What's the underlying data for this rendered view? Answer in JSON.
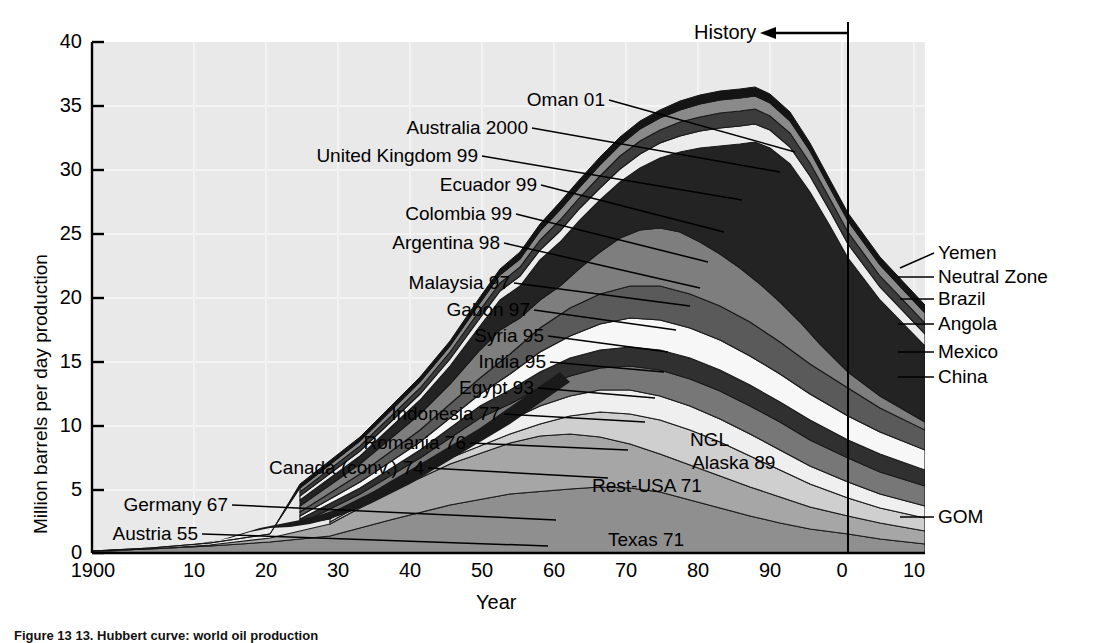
{
  "figure": {
    "caption": "Figure 13  13. Hubbert curve: world oil production"
  },
  "chart_data": {
    "type": "area",
    "stacked": true,
    "title": "",
    "xlabel": "Year",
    "ylabel": "Million barrels per day production",
    "xlim": [
      1900,
      2016
    ],
    "ylim": [
      0,
      40
    ],
    "ytick_values": [
      0,
      5,
      10,
      15,
      20,
      25,
      30,
      35,
      40
    ],
    "ytick_labels": [
      "0",
      "5",
      "10",
      "15",
      "20",
      "25",
      "30",
      "35",
      "40"
    ],
    "xtick_values": [
      1900,
      1910,
      1920,
      1930,
      1940,
      1950,
      1960,
      1970,
      1980,
      1990,
      2000,
      2010
    ],
    "xtick_labels": [
      "1900",
      "10",
      "20",
      "30",
      "40",
      "50",
      "60",
      "70",
      "80",
      "90",
      "0",
      "10"
    ],
    "grid": true,
    "legend": "none",
    "annotations": {
      "history_label": "History",
      "history_line_year": 2005
    },
    "x": [
      1900,
      1905,
      1910,
      1915,
      1920,
      1925,
      1930,
      1935,
      1940,
      1945,
      1950,
      1955,
      1960,
      1965,
      1970,
      1971,
      1973,
      1975,
      1977,
      1979,
      1980,
      1982,
      1985,
      1988,
      1990,
      1992,
      1995,
      1998,
      2000,
      2002,
      2004,
      2005,
      2006,
      2008,
      2010,
      2012,
      2014,
      2016
    ],
    "total_values": [
      0.4,
      0.6,
      0.9,
      1.2,
      1.9,
      2.6,
      3.4,
      3.8,
      5.2,
      6.2,
      9.6,
      13.2,
      18.4,
      24.0,
      32.0,
      33.2,
      35.5,
      33.0,
      36.5,
      38.0,
      36.0,
      32.0,
      31.5,
      34.0,
      35.5,
      35.0,
      36.0,
      38.0,
      39.0,
      38.5,
      40.0,
      40.0,
      39.5,
      38.0,
      35.5,
      33.0,
      30.5,
      28.0
    ],
    "series": [
      {
        "name": "Texas 71",
        "peak_year": 1971,
        "label": "Texas 71",
        "color": "#8c8c8c"
      },
      {
        "name": "Rest-USA 71",
        "peak_year": 1971,
        "label": "Rest-USA 71",
        "color": "#a6a6a6"
      },
      {
        "name": "Alaska 89",
        "peak_year": 1989,
        "label": "Alaska 89",
        "color": "#d9d9d9"
      },
      {
        "name": "NGL",
        "peak_year": null,
        "label": "NGL",
        "color": "#f2f2f2"
      },
      {
        "name": "GOM",
        "peak_year": null,
        "label": "GOM",
        "color": "#bfbfbf"
      },
      {
        "name": "Austria 55",
        "peak_year": 1955,
        "label": "Austria 55",
        "color": "#1a1a1a"
      },
      {
        "name": "Germany 67",
        "peak_year": 1967,
        "label": "Germany 67",
        "color": "#333333"
      },
      {
        "name": "Canada (conv.) 74",
        "peak_year": 1974,
        "label": "Canada (conv.) 74",
        "color": "#4d4d4d"
      },
      {
        "name": "Romania 76",
        "peak_year": 1976,
        "label": "Romania 76",
        "color": "#666666"
      },
      {
        "name": "Indonesia 77",
        "peak_year": 1977,
        "label": "Indonesia 77",
        "color": "#7a7a7a"
      },
      {
        "name": "Egypt 93",
        "peak_year": 1993,
        "label": "Egypt 93",
        "color": "#999999"
      },
      {
        "name": "India 95",
        "peak_year": 1995,
        "label": "India 95",
        "color": "#2b2b2b"
      },
      {
        "name": "Syria 95",
        "peak_year": 1995,
        "label": "Syria 95",
        "color": "#5c5c5c"
      },
      {
        "name": "Gabon 97",
        "peak_year": 1997,
        "label": "Gabon 97",
        "color": "#8f8f8f"
      },
      {
        "name": "Malaysia 97",
        "peak_year": 1997,
        "label": "Malaysia 97",
        "color": "#404040"
      },
      {
        "name": "Argentina 98",
        "peak_year": 1998,
        "label": "Argentina 98",
        "color": "#6e6e6e"
      },
      {
        "name": "Colombia 99",
        "peak_year": 1999,
        "label": "Colombia 99",
        "color": "#b3b3b3"
      },
      {
        "name": "Ecuador 99",
        "peak_year": 1999,
        "label": "Ecuador 99",
        "color": "#262626"
      },
      {
        "name": "United Kingdom 99",
        "peak_year": 1999,
        "label": "United Kingdom 99",
        "color": "#555555"
      },
      {
        "name": "Australia 2000",
        "peak_year": 2000,
        "label": "Australia 2000",
        "color": "#ededed"
      },
      {
        "name": "Oman 01",
        "peak_year": 2001,
        "label": "Oman 01",
        "color": "#737373"
      },
      {
        "name": "Norway 01",
        "peak_year": 2001,
        "label": "Norway 01",
        "color": "#1f1f1f"
      },
      {
        "name": "China",
        "peak_year": null,
        "label": "China",
        "color": "#a0a0a0"
      },
      {
        "name": "Mexico",
        "peak_year": null,
        "label": "Mexico",
        "color": "#303030"
      },
      {
        "name": "Angola",
        "peak_year": null,
        "label": "Angola",
        "color": "#717171"
      },
      {
        "name": "Brazil",
        "peak_year": null,
        "label": "Brazil",
        "color": "#2e2e2e"
      },
      {
        "name": "Neutral Zone",
        "peak_year": null,
        "label": "Neutral Zone",
        "color": "#949494"
      },
      {
        "name": "Yemen",
        "peak_year": null,
        "label": "Yemen",
        "color": "#585858"
      }
    ],
    "left_callouts": [
      {
        "label": "Oman 01",
        "x": 605,
        "y": 100,
        "tx": 795,
        "ty": 152
      },
      {
        "label": "Australia 2000",
        "x": 528,
        "y": 128,
        "tx": 780,
        "ty": 172
      },
      {
        "label": "United Kingdom 99",
        "x": 478,
        "y": 156,
        "tx": 742,
        "ty": 200
      },
      {
        "label": "Ecuador 99",
        "x": 537,
        "y": 185,
        "tx": 724,
        "ty": 232
      },
      {
        "label": "Colombia 99",
        "x": 512,
        "y": 214,
        "tx": 708,
        "ty": 262
      },
      {
        "label": "Argentina 98",
        "x": 500,
        "y": 243,
        "tx": 700,
        "ty": 288
      },
      {
        "label": "Malaysia 97",
        "x": 510,
        "y": 283,
        "tx": 690,
        "ty": 306
      },
      {
        "label": "Gabon 97",
        "x": 530,
        "y": 310,
        "tx": 676,
        "ty": 330
      },
      {
        "label": "Syria 95",
        "x": 544,
        "y": 336,
        "tx": 668,
        "ty": 352
      },
      {
        "label": "India 95",
        "x": 546,
        "y": 362,
        "tx": 664,
        "ty": 372
      },
      {
        "label": "Egypt 93",
        "x": 534,
        "y": 388,
        "tx": 655,
        "ty": 398
      },
      {
        "label": "Indonesia 77",
        "x": 500,
        "y": 414,
        "tx": 645,
        "ty": 422
      },
      {
        "label": "Romania 76",
        "x": 466,
        "y": 443,
        "tx": 628,
        "ty": 450
      },
      {
        "label": "Canada (conv.) 74",
        "x": 424,
        "y": 468,
        "tx": 608,
        "ty": 478
      },
      {
        "label": "Germany 67",
        "x": 228,
        "y": 505,
        "tx": 556,
        "ty": 520
      },
      {
        "label": "Austria 55",
        "x": 198,
        "y": 534,
        "tx": 548,
        "ty": 546
      }
    ],
    "right_callouts": [
      {
        "label": "Yemen",
        "x": 938,
        "y": 253,
        "tx": 900,
        "ty": 268
      },
      {
        "label": "Neutral Zone",
        "x": 938,
        "y": 277,
        "tx": 898,
        "ty": 277
      },
      {
        "label": "Brazil",
        "x": 938,
        "y": 299,
        "tx": 900,
        "ty": 299
      },
      {
        "label": "Angola",
        "x": 938,
        "y": 324,
        "tx": 898,
        "ty": 324
      },
      {
        "label": "Mexico",
        "x": 938,
        "y": 352,
        "tx": 898,
        "ty": 352
      },
      {
        "label": "China",
        "x": 938,
        "y": 377,
        "tx": 898,
        "ty": 377
      },
      {
        "label": "GOM",
        "x": 938,
        "y": 517,
        "tx": 900,
        "ty": 517
      }
    ],
    "inner_labels": [
      {
        "label": "NGL",
        "x": 690,
        "y": 440
      },
      {
        "label": "Alaska 89",
        "x": 692,
        "y": 463
      },
      {
        "label": "Rest-USA 71",
        "x": 592,
        "y": 486
      },
      {
        "label": "Texas 71",
        "x": 608,
        "y": 540
      }
    ]
  }
}
